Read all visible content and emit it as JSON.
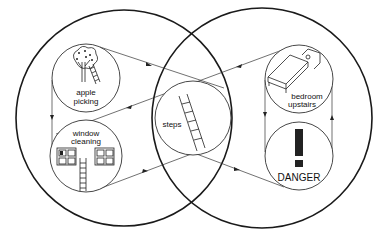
{
  "diagram": {
    "type": "overlapping-sets-concept-map",
    "sets": [
      {
        "id": "left-set",
        "center": [
          124,
          118
        ],
        "radius": 108
      },
      {
        "id": "right-set",
        "center": [
          262,
          118
        ],
        "radius": 110
      }
    ],
    "nodes": {
      "apple_picking": {
        "line1": "apple",
        "line2": "picking",
        "icon": "apple-tree-with-ladder-icon"
      },
      "window_cleaning": {
        "line1": "window",
        "line2": "cleaning",
        "icon": "windows-with-ladder-icon"
      },
      "steps": {
        "label": "steps",
        "icon": "ladder-icon"
      },
      "bedroom_upstairs": {
        "line1": "bedroom",
        "line2": "upstairs",
        "icon": "bed-icon"
      },
      "danger": {
        "label": "DANGER",
        "glyph": "!",
        "icon": "exclamation-icon"
      }
    },
    "edges": [
      {
        "from": "apple_picking",
        "to": "steps"
      },
      {
        "from": "apple_picking",
        "to": "window_cleaning"
      },
      {
        "from": "window_cleaning",
        "to": "steps"
      },
      {
        "from": "steps",
        "to": "window_cleaning"
      },
      {
        "from": "bedroom_upstairs",
        "to": "steps"
      },
      {
        "from": "bedroom_upstairs",
        "to": "danger"
      },
      {
        "from": "danger",
        "to": "bedroom_upstairs"
      },
      {
        "from": "steps",
        "to": "danger"
      }
    ],
    "colors": {
      "ink": "#1a1a1a",
      "background": "#ffffff"
    }
  }
}
